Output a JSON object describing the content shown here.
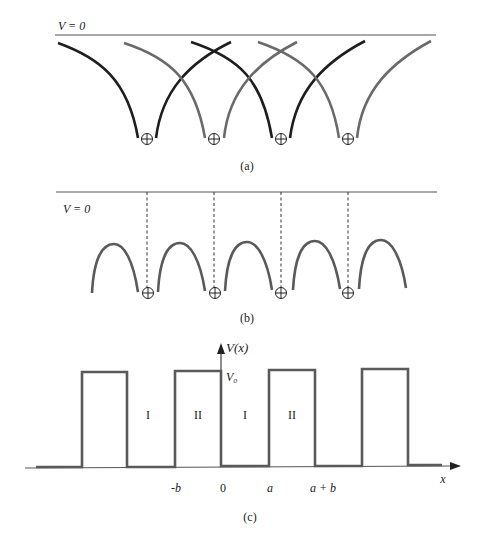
{
  "colors": {
    "dark_curve": "#1e1e1e",
    "gray_curve": "#6a6a6a",
    "line": "#555555",
    "text": "#222222"
  },
  "panel_a": {
    "v_zero_label": "V = 0",
    "caption": "(a)",
    "ion_symbol": "⊕",
    "ion_count": 4
  },
  "panel_b": {
    "v_zero_label": "V = 0",
    "caption": "(b)",
    "ion_symbol": "⊕",
    "ion_count": 4,
    "hump_count": 5
  },
  "panel_c": {
    "y_axis_label": "V(x)",
    "x_axis_label": "x",
    "barrier_height_label": "V₀",
    "region_labels": [
      "I",
      "II",
      "I",
      "II"
    ],
    "tick_labels": [
      "-b",
      "0",
      "a",
      "a + b"
    ],
    "caption": "(c)",
    "barrier_count": 4
  }
}
